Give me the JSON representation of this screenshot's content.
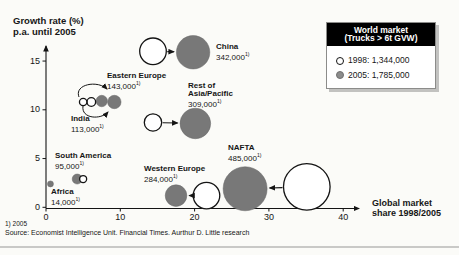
{
  "chart_data": {
    "type": "bubble",
    "title_lines": [
      "Growth rate (%)",
      "p.a. until 2005"
    ],
    "xlabel_lines": [
      "Global market",
      "share 1998/2005"
    ],
    "x_ticks": [
      0,
      10,
      20,
      30,
      40
    ],
    "y_ticks": [
      0,
      5,
      10,
      15
    ],
    "xlim": [
      0,
      44
    ],
    "ylim": [
      0,
      17.5
    ],
    "footnote_marker": "1)",
    "legend": {
      "title_lines": [
        "World market",
        "(Trucks > 6t GVW)"
      ],
      "items": [
        {
          "style": "open",
          "text": "1998: 1,344,000"
        },
        {
          "style": "filled",
          "text": "2005: 1,785,000"
        }
      ]
    },
    "regions": [
      {
        "id": "china",
        "name_lines": [
          "China"
        ],
        "value_2005": "342,000",
        "open": {
          "share": 14.4,
          "growth": 16.0
        },
        "filled": {
          "share": 19.8,
          "growth": 15.9
        }
      },
      {
        "id": "e_europe",
        "name_lines": [
          "Eastern Europe"
        ],
        "value_2005": "143,000",
        "open": {
          "share": 6.1,
          "growth": 10.8
        },
        "filled": {
          "share": 9.2,
          "growth": 10.8
        }
      },
      {
        "id": "india",
        "name_lines": [
          "India"
        ],
        "value_2005": "113,000",
        "open": {
          "share": 5.0,
          "growth": 10.8
        },
        "filled": {
          "share": 7.5,
          "growth": 10.9
        }
      },
      {
        "id": "asia_pacific",
        "name_lines": [
          "Rest of",
          "Asia/Pacific"
        ],
        "value_2005": "309,000",
        "open": {
          "share": 14.4,
          "growth": 8.7
        },
        "filled": {
          "share": 20.1,
          "growth": 8.6
        }
      },
      {
        "id": "nafta",
        "name_lines": [
          "NAFTA"
        ],
        "value_2005": "485,000",
        "open": {
          "share": 35.1,
          "growth": 2.1
        },
        "filled": {
          "share": 26.8,
          "growth": 1.9
        }
      },
      {
        "id": "w_europe",
        "name_lines": [
          "Western Europe"
        ],
        "value_2005": "284,000",
        "open": {
          "share": 21.6,
          "growth": 1.2
        },
        "filled": {
          "share": 17.5,
          "growth": 1.2
        }
      },
      {
        "id": "s_america",
        "name_lines": [
          "South America"
        ],
        "value_2005": "95,000",
        "open": {
          "share": 5.0,
          "growth": 2.9
        },
        "filled": {
          "share": 4.2,
          "growth": 2.9
        }
      },
      {
        "id": "africa",
        "name_lines": [
          "Africa"
        ],
        "value_2005": "14,000",
        "open": null,
        "filled": {
          "share": 0.6,
          "growth": 2.4
        }
      }
    ],
    "colors": {
      "bubble_2005_fill": "#787878",
      "bubble_1998_fill": "#ffffff",
      "axis": "#141414",
      "legend_header_bg": "#000000",
      "legend_header_text": "#ffffff"
    }
  },
  "footnotes": {
    "note": "1) 2005",
    "source": "Source: Economist Intelligence Unit. Financial Times. Aurthur D. Little research"
  }
}
